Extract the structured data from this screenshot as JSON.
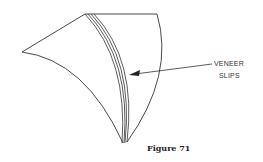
{
  "figure": {
    "caption": "Figure 71",
    "callout_line1": "VENEER",
    "callout_line2": "SLIPS"
  },
  "colors": {
    "line": "#333333",
    "background": "#ffffff"
  }
}
